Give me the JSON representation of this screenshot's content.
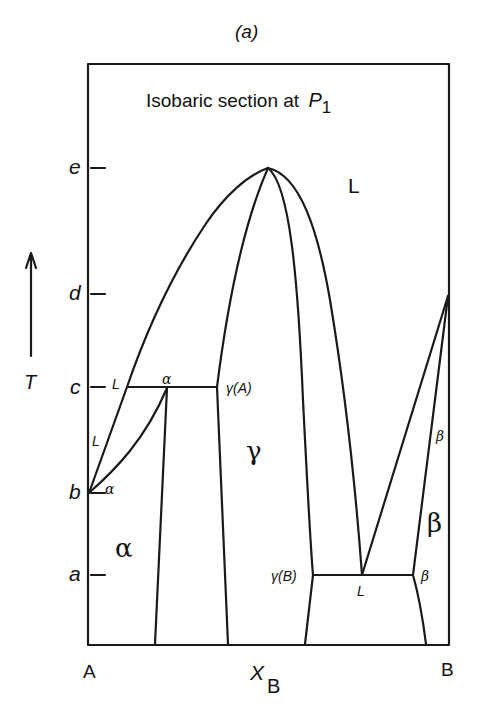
{
  "figure": {
    "panel_label": "(a)",
    "title": "Isobaric section at",
    "title_var": "P",
    "title_sub": "1"
  },
  "axes": {
    "y_axis_label": "T",
    "y_ticks": [
      "e",
      "d",
      "c",
      "b",
      "a"
    ],
    "x_axis_label": "X",
    "x_axis_sub": "B",
    "x_left": "A",
    "x_right": "B"
  },
  "regions": {
    "liquid": "L",
    "alpha": "α",
    "gamma": "γ",
    "beta": "β"
  },
  "point_labels": {
    "c_L": "L",
    "c_alpha": "α",
    "c_gammaA": "γ(A)",
    "b_L": "L",
    "b_alpha": "α",
    "a_gammaB": "γ(B)",
    "a_L": "L",
    "a_beta": "β",
    "d_beta": "β"
  },
  "colors": {
    "line": "#1a1a1a",
    "background": "#ffffff"
  }
}
